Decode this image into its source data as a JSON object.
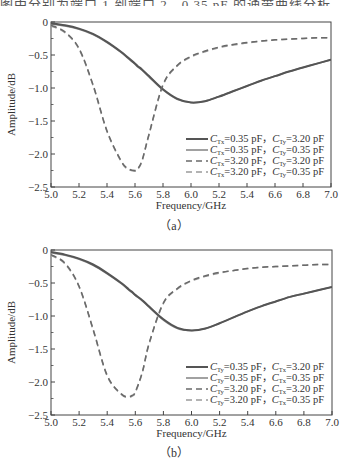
{
  "header_fragment": "图中分别为端口 1 到端口 2，0.35 pF 的通带曲线分析",
  "chart_data": [
    {
      "type": "line",
      "panel_label": "(a)",
      "xlabel": "Frequency/GHz",
      "ylabel": "Amplitude/dB",
      "xlim": [
        5.0,
        7.0
      ],
      "ylim": [
        -2.5,
        0
      ],
      "x_tick_labels": [
        "5.0",
        "5.2",
        "5.4",
        "5.6",
        "5.8",
        "6.0",
        "5.2",
        "5.4",
        "6.6",
        "6.8",
        "7.0"
      ],
      "y_tick_labels": [
        "0",
        "-0.5",
        "-1.0",
        "-1.5",
        "-2.0",
        "-2.5"
      ],
      "grid": false,
      "legend_position": "lower right",
      "x": [
        5.0,
        5.1,
        5.2,
        5.3,
        5.4,
        5.5,
        5.55,
        5.6,
        5.62,
        5.65,
        5.7,
        5.8,
        5.9,
        6.0,
        6.1,
        6.2,
        6.3,
        6.4,
        6.5,
        6.6,
        6.7,
        6.8,
        6.9,
        7.0
      ],
      "series": [
        {
          "name": "C_Tx=0.35 pF, C_Ty=3.20 pF",
          "style": "solid-dark",
          "values": [
            -0.02,
            -0.05,
            -0.1,
            -0.18,
            -0.3,
            -0.45,
            -0.54,
            -0.63,
            -0.67,
            -0.72,
            -0.82,
            -1.02,
            -1.16,
            -1.22,
            -1.2,
            -1.13,
            -1.05,
            -0.97,
            -0.89,
            -0.82,
            -0.75,
            -0.69,
            -0.63,
            -0.57
          ]
        },
        {
          "name": "C_Tx=0.35 pF, C_Ty=0.35 pF",
          "style": "solid-light",
          "values": [
            -0.03,
            -0.06,
            -0.11,
            -0.19,
            -0.31,
            -0.46,
            -0.55,
            -0.64,
            -0.68,
            -0.73,
            -0.83,
            -1.03,
            -1.17,
            -1.22,
            -1.2,
            -1.13,
            -1.05,
            -0.97,
            -0.89,
            -0.82,
            -0.75,
            -0.69,
            -0.63,
            -0.57
          ]
        },
        {
          "name": "C_Tx=3.20 pF, C_Ty=3.20 pF",
          "style": "dashed-dark",
          "values": [
            -0.05,
            -0.15,
            -0.4,
            -0.95,
            -1.65,
            -2.1,
            -2.22,
            -2.25,
            -2.22,
            -2.1,
            -1.7,
            -0.95,
            -0.66,
            -0.52,
            -0.44,
            -0.38,
            -0.34,
            -0.31,
            -0.29,
            -0.27,
            -0.26,
            -0.25,
            -0.24,
            -0.24
          ]
        },
        {
          "name": "C_Tx=3.20 pF, C_Ty=0.35 pF",
          "style": "dashed-light",
          "values": [
            -0.06,
            -0.16,
            -0.41,
            -0.96,
            -1.66,
            -2.11,
            -2.23,
            -2.26,
            -2.23,
            -2.11,
            -1.71,
            -0.96,
            -0.67,
            -0.53,
            -0.45,
            -0.39,
            -0.35,
            -0.32,
            -0.29,
            -0.27,
            -0.26,
            -0.25,
            -0.24,
            -0.24
          ]
        }
      ]
    },
    {
      "type": "line",
      "panel_label": "(b)",
      "xlabel": "Frequency/GHz",
      "ylabel": "Amplitude/dB",
      "xlim": [
        5.0,
        7.0
      ],
      "ylim": [
        -2.5,
        0
      ],
      "x_tick_labels": [
        "5.0",
        "5.2",
        "5.4",
        "5.6",
        "5.8",
        "6.0",
        "5.2",
        "5.4",
        "6.6",
        "6.8",
        "7.0"
      ],
      "y_tick_labels": [
        "0",
        "-0.5",
        "-1.0",
        "-1.5",
        "-2.0",
        "-2.5"
      ],
      "grid": false,
      "legend_position": "lower right",
      "x": [
        5.0,
        5.1,
        5.2,
        5.3,
        5.4,
        5.5,
        5.55,
        5.58,
        5.6,
        5.65,
        5.7,
        5.8,
        5.9,
        6.0,
        6.1,
        6.2,
        6.3,
        6.4,
        6.5,
        6.6,
        6.7,
        6.8,
        6.9,
        7.0
      ],
      "series": [
        {
          "name": "C_Ty=0.35 pF, C_Tx=3.20 pF",
          "style": "solid-dark",
          "values": [
            -0.03,
            -0.07,
            -0.13,
            -0.22,
            -0.35,
            -0.5,
            -0.59,
            -0.64,
            -0.68,
            -0.76,
            -0.86,
            -1.05,
            -1.18,
            -1.22,
            -1.19,
            -1.11,
            -1.02,
            -0.93,
            -0.85,
            -0.78,
            -0.71,
            -0.66,
            -0.61,
            -0.56
          ]
        },
        {
          "name": "C_Ty=0.35 pF, C_Tx=0.35 pF",
          "style": "solid-light",
          "values": [
            -0.04,
            -0.08,
            -0.14,
            -0.23,
            -0.36,
            -0.51,
            -0.6,
            -0.65,
            -0.69,
            -0.77,
            -0.87,
            -1.06,
            -1.19,
            -1.22,
            -1.19,
            -1.11,
            -1.02,
            -0.93,
            -0.85,
            -0.78,
            -0.71,
            -0.66,
            -0.61,
            -0.56
          ]
        },
        {
          "name": "C_Ty=3.20 pF, C_Tx=3.20 pF",
          "style": "dashed-dark",
          "values": [
            -0.07,
            -0.2,
            -0.55,
            -1.2,
            -1.9,
            -2.18,
            -2.22,
            -2.2,
            -2.15,
            -1.85,
            -1.4,
            -0.8,
            -0.58,
            -0.46,
            -0.39,
            -0.34,
            -0.31,
            -0.28,
            -0.26,
            -0.25,
            -0.24,
            -0.23,
            -0.22,
            -0.22
          ]
        },
        {
          "name": "C_Ty=3.20 pF, C_Tx=0.35 pF",
          "style": "dashed-light",
          "values": [
            -0.08,
            -0.21,
            -0.56,
            -1.21,
            -1.91,
            -2.19,
            -2.23,
            -2.21,
            -2.16,
            -1.86,
            -1.41,
            -0.81,
            -0.59,
            -0.47,
            -0.4,
            -0.35,
            -0.31,
            -0.28,
            -0.26,
            -0.25,
            -0.24,
            -0.23,
            -0.22,
            -0.22
          ]
        }
      ]
    }
  ],
  "legends": {
    "a": [
      {
        "c1": "C",
        "s1": "Tx",
        "v1": "=0.35 pF，",
        "c2": "C",
        "s2": "Ty",
        "v2": "=3.20 pF"
      },
      {
        "c1": "C",
        "s1": "Tx",
        "v1": "=0.35 pF，",
        "c2": "C",
        "s2": "Ty",
        "v2": "=0.35 pF"
      },
      {
        "c1": "C",
        "s1": "Tx",
        "v1": "=3.20 pF，",
        "c2": "C",
        "s2": "Ty",
        "v2": "=3.20 pF"
      },
      {
        "c1": "C",
        "s1": "Tx",
        "v1": "=3.20 pF，",
        "c2": "C",
        "s2": "Ty",
        "v2": "=0.35 pF"
      }
    ],
    "b": [
      {
        "c1": "C",
        "s1": "Ty",
        "v1": "=0.35 pF，",
        "c2": "C",
        "s2": "Tx",
        "v2": "=3.20 pF"
      },
      {
        "c1": "C",
        "s1": "Ty",
        "v1": "=0.35 pF，",
        "c2": "C",
        "s2": "Tx",
        "v2": "=0.35 pF"
      },
      {
        "c1": "C",
        "s1": "Ty",
        "v1": "=3.20 pF，",
        "c2": "C",
        "s2": "Tx",
        "v2": "=3.20 pF"
      },
      {
        "c1": "C",
        "s1": "Ty",
        "v1": "=3.20 pF，",
        "c2": "C",
        "s2": "Tx",
        "v2": "=0.35 pF"
      }
    ]
  },
  "captions": {
    "a": "（a）",
    "b": "（b）"
  },
  "colors": {
    "solid-dark": "#555555",
    "solid-light": "#8a8a8a",
    "dashed-dark": "#6a6a6a",
    "dashed-light": "#9a9a9a",
    "axis": "#444444"
  }
}
